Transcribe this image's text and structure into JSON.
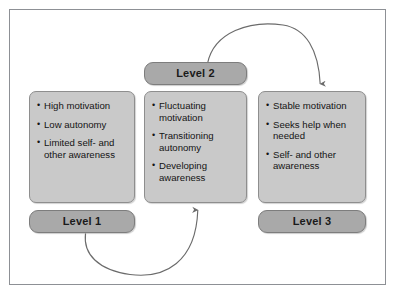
{
  "figure": {
    "frame_color": "#8d9095",
    "content_box_color": "#c9c9c9",
    "label_box_color": "#a9a9a9",
    "arrow_color": "#6b6b6b",
    "background": "#ffffff"
  },
  "nodes": [
    {
      "id": "level1",
      "label": "Level 1",
      "bullets": [
        "High motivation",
        "Low autonomy",
        "Limited self- and other awareness"
      ]
    },
    {
      "id": "level2",
      "label": "Level 2",
      "bullets": [
        "Fluctuating motivation",
        "Transitioning autonomy",
        "Developing awareness"
      ]
    },
    {
      "id": "level3",
      "label": "Level 3",
      "bullets": [
        "Stable motivation",
        "Seeks help when needed",
        "Self- and other awareness"
      ]
    }
  ],
  "arrows": [
    {
      "id": "arrow-level2-to-level3",
      "from": "Level 2",
      "to": "Level 3"
    },
    {
      "id": "arrow-level1-to-level2",
      "from": "Level 1",
      "to": "Level 2"
    }
  ]
}
